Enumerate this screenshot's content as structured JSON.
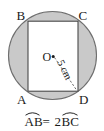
{
  "figure": {
    "shapes": {
      "circle": {
        "name": "shaded-circle",
        "fill_color": "#c9c9c9",
        "stroke_color": "#6e6e6e",
        "center_label": "O",
        "center_dot": "•"
      },
      "rectangle": {
        "name": "inscribed-rectangle",
        "fill_color": "#ffffff",
        "stroke_color": "#4a4a4a",
        "vertices": [
          {
            "label": "B",
            "position": "top-left"
          },
          {
            "label": "C",
            "position": "top-right"
          },
          {
            "label": "D",
            "position": "bottom-right"
          },
          {
            "label": "A",
            "position": "bottom-left"
          }
        ]
      },
      "radius": {
        "name": "radius-segment",
        "style": "dashed",
        "stroke_color": "#5a5a5a",
        "length_label": "5 cm",
        "value": 5,
        "unit": "cm",
        "rotation_deg": 64
      }
    },
    "caption": {
      "full_text": "AB = 2BC",
      "left_term": "AB",
      "operator": "=",
      "right_coefficient": "2",
      "right_term": "BC",
      "overline_marks": [
        "AB",
        "BC"
      ]
    }
  }
}
